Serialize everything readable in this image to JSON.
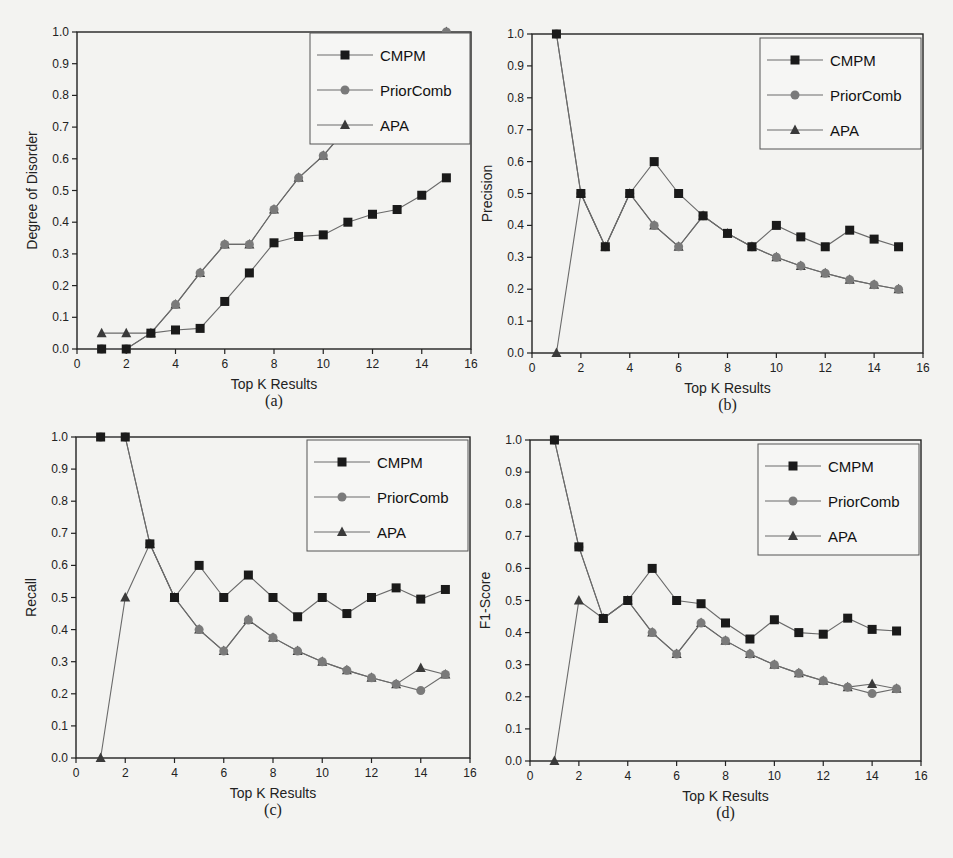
{
  "figure": {
    "panels": [
      {
        "id": "a",
        "caption": "(a)",
        "ylabel": "Degree of Disorder",
        "xlabel": "Top K Results",
        "box": {
          "left": 77,
          "top": 32,
          "right": 471,
          "bottom": 349
        },
        "legend": {
          "x": 310,
          "y": 33,
          "w": 160,
          "h": 111
        }
      },
      {
        "id": "b",
        "caption": "(b)",
        "ylabel": "Precision",
        "xlabel": "Top K Results",
        "box": {
          "left": 532,
          "top": 34,
          "right": 923,
          "bottom": 353
        },
        "legend": {
          "x": 760,
          "y": 38,
          "w": 161,
          "h": 111
        }
      },
      {
        "id": "c",
        "caption": "(c)",
        "ylabel": "Recall",
        "xlabel": "Top K Results",
        "box": {
          "left": 76,
          "top": 437,
          "right": 470,
          "bottom": 758
        },
        "legend": {
          "x": 307,
          "y": 440,
          "w": 161,
          "h": 111
        }
      },
      {
        "id": "d",
        "caption": "(d)",
        "ylabel": "F1-Score",
        "xlabel": "Top K Results",
        "box": {
          "left": 530,
          "top": 440,
          "right": 921,
          "bottom": 761
        },
        "legend": {
          "x": 758,
          "y": 444,
          "w": 161,
          "h": 111
        }
      }
    ],
    "xticks": [
      "0",
      "2",
      "4",
      "6",
      "8",
      "10",
      "12",
      "14",
      "16"
    ],
    "yticks": [
      "0.0",
      "0.1",
      "0.2",
      "0.3",
      "0.4",
      "0.5",
      "0.6",
      "0.7",
      "0.8",
      "0.9",
      "1.0"
    ],
    "legend_labels": [
      "CMPM",
      "PriorComb",
      "APA"
    ],
    "colors": {
      "CMPM": "#1a1a1a",
      "PriorComb": "#7a7a7a",
      "APA": "#3a3a3a",
      "line": "#6a6a6a",
      "axis": "#222222"
    }
  },
  "chart_data": [
    {
      "type": "line",
      "title": "(a)",
      "xlabel": "Top K Results",
      "ylabel": "Degree of Disorder",
      "xlim": [
        0,
        16
      ],
      "ylim": [
        0,
        1.0
      ],
      "legend_position": "upper right",
      "x": [
        1,
        2,
        3,
        4,
        5,
        6,
        7,
        8,
        9,
        10,
        11,
        12,
        13,
        14,
        15
      ],
      "series": [
        {
          "name": "CMPM",
          "marker": "square",
          "values": [
            0.0,
            0.0,
            0.05,
            0.06,
            0.065,
            0.15,
            0.24,
            0.335,
            0.355,
            0.36,
            0.4,
            0.425,
            0.44,
            0.485,
            0.54
          ]
        },
        {
          "name": "PriorComb",
          "marker": "circle",
          "values": [
            0.0,
            0.0,
            0.05,
            0.14,
            0.24,
            0.33,
            0.33,
            0.44,
            0.54,
            0.61,
            0.7,
            0.78,
            0.85,
            0.92,
            1.0
          ]
        },
        {
          "name": "APA",
          "marker": "triangle",
          "values": [
            0.05,
            0.05,
            0.05,
            0.14,
            0.24,
            0.33,
            0.33,
            0.44,
            0.54,
            0.61,
            0.7,
            0.78,
            0.85,
            0.92,
            1.0
          ]
        }
      ]
    },
    {
      "type": "line",
      "title": "(b)",
      "xlabel": "Top K Results",
      "ylabel": "Precision",
      "xlim": [
        0,
        16
      ],
      "ylim": [
        0,
        1.0
      ],
      "legend_position": "upper right",
      "x": [
        1,
        2,
        3,
        4,
        5,
        6,
        7,
        8,
        9,
        10,
        11,
        12,
        13,
        14,
        15
      ],
      "series": [
        {
          "name": "CMPM",
          "marker": "square",
          "values": [
            1.0,
            0.5,
            0.333,
            0.5,
            0.6,
            0.5,
            0.43,
            0.375,
            0.333,
            0.4,
            0.364,
            0.333,
            0.385,
            0.357,
            0.333
          ]
        },
        {
          "name": "PriorComb",
          "marker": "circle",
          "values": [
            1.0,
            0.5,
            0.333,
            0.5,
            0.4,
            0.333,
            0.43,
            0.375,
            0.333,
            0.3,
            0.273,
            0.25,
            0.23,
            0.214,
            0.2
          ]
        },
        {
          "name": "APA",
          "marker": "triangle",
          "values": [
            0.0,
            0.5,
            0.333,
            0.5,
            0.4,
            0.333,
            0.43,
            0.375,
            0.333,
            0.3,
            0.273,
            0.25,
            0.23,
            0.214,
            0.2
          ]
        }
      ]
    },
    {
      "type": "line",
      "title": "(c)",
      "xlabel": "Top K Results",
      "ylabel": "Recall",
      "xlim": [
        0,
        16
      ],
      "ylim": [
        0,
        1.0
      ],
      "legend_position": "upper right",
      "x": [
        1,
        2,
        3,
        4,
        5,
        6,
        7,
        8,
        9,
        10,
        11,
        12,
        13,
        14,
        15
      ],
      "series": [
        {
          "name": "CMPM",
          "marker": "square",
          "values": [
            1.0,
            1.0,
            0.667,
            0.5,
            0.6,
            0.5,
            0.57,
            0.5,
            0.44,
            0.5,
            0.45,
            0.5,
            0.53,
            0.495,
            0.525
          ]
        },
        {
          "name": "PriorComb",
          "marker": "circle",
          "values": [
            1.0,
            1.0,
            0.667,
            0.5,
            0.4,
            0.333,
            0.43,
            0.375,
            0.333,
            0.3,
            0.273,
            0.25,
            0.23,
            0.21,
            0.26
          ]
        },
        {
          "name": "APA",
          "marker": "triangle",
          "values": [
            0.0,
            0.5,
            0.667,
            0.5,
            0.4,
            0.333,
            0.43,
            0.375,
            0.333,
            0.3,
            0.273,
            0.25,
            0.23,
            0.28,
            0.26
          ]
        }
      ]
    },
    {
      "type": "line",
      "title": "(d)",
      "xlabel": "Top K Results",
      "ylabel": "F1-Score",
      "xlim": [
        0,
        16
      ],
      "ylim": [
        0,
        1.0
      ],
      "legend_position": "upper right",
      "x": [
        1,
        2,
        3,
        4,
        5,
        6,
        7,
        8,
        9,
        10,
        11,
        12,
        13,
        14,
        15
      ],
      "series": [
        {
          "name": "CMPM",
          "marker": "square",
          "values": [
            1.0,
            0.667,
            0.444,
            0.5,
            0.6,
            0.5,
            0.49,
            0.43,
            0.38,
            0.44,
            0.4,
            0.395,
            0.445,
            0.41,
            0.405
          ]
        },
        {
          "name": "PriorComb",
          "marker": "circle",
          "values": [
            1.0,
            0.667,
            0.444,
            0.5,
            0.4,
            0.333,
            0.43,
            0.375,
            0.333,
            0.3,
            0.273,
            0.25,
            0.23,
            0.21,
            0.225
          ]
        },
        {
          "name": "APA",
          "marker": "triangle",
          "values": [
            0.0,
            0.5,
            0.444,
            0.5,
            0.4,
            0.333,
            0.43,
            0.375,
            0.333,
            0.3,
            0.273,
            0.25,
            0.23,
            0.24,
            0.225
          ]
        }
      ]
    }
  ]
}
